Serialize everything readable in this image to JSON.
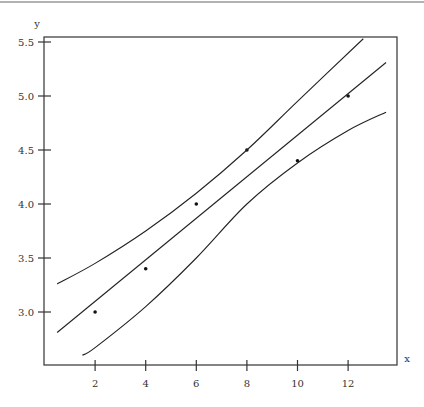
{
  "chart_data": {
    "type": "scatter",
    "title": "",
    "xlabel": "x",
    "ylabel": "y",
    "xlim": [
      0.5,
      13.5
    ],
    "ylim": [
      2.8,
      5.55
    ],
    "grid": false,
    "legend": null,
    "x_ticks": [
      2,
      4,
      6,
      8,
      10,
      12
    ],
    "x_tick_labels": [
      "2",
      "4",
      "6",
      "8",
      "10",
      "12"
    ],
    "y_ticks": [
      3.0,
      3.5,
      4.0,
      4.5,
      5.0,
      5.5
    ],
    "y_tick_labels": [
      "3.0",
      "3.5",
      "4.0",
      "4.5",
      "5.0",
      "5.5"
    ],
    "series": [
      {
        "name": "observations",
        "kind": "points",
        "x": [
          2,
          4,
          6,
          8,
          10,
          12
        ],
        "y": [
          3.0,
          3.4,
          4.0,
          4.5,
          4.4,
          5.0
        ]
      },
      {
        "name": "regression line",
        "kind": "line",
        "x": [
          0.5,
          13.5
        ],
        "y": [
          2.81,
          5.31
        ]
      },
      {
        "name": "upper confidence band",
        "kind": "curve",
        "x": [
          0.5,
          2,
          4,
          6,
          8,
          10,
          12.6
        ],
        "y": [
          3.26,
          3.45,
          3.75,
          4.1,
          4.5,
          4.95,
          5.53
        ]
      },
      {
        "name": "lower confidence band",
        "kind": "curve",
        "x": [
          1.5,
          2,
          4,
          6,
          8,
          10,
          12,
          13.5
        ],
        "y": [
          2.6,
          2.67,
          3.05,
          3.5,
          4.0,
          4.38,
          4.68,
          4.85
        ]
      }
    ]
  },
  "axes": {
    "x_label": "x",
    "y_label": "y"
  }
}
